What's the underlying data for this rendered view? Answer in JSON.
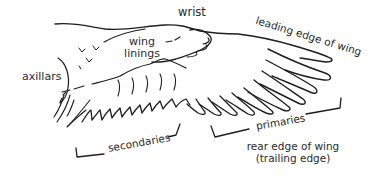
{
  "diagram": {
    "labels": {
      "wrist": "wrist",
      "leading_edge": "leading edge of wing",
      "wing_linings_line1": "wing",
      "wing_linings_line2": "linings",
      "axillars": "axillars",
      "secondaries": "secondaries",
      "primaries": "primaries",
      "rear_edge_line1": "rear edge of wing",
      "rear_edge_line2": "(trailing edge)"
    },
    "colors": {
      "line": "#1e1e1e",
      "text": "#2a2a2a",
      "background": "#ffffff"
    }
  }
}
